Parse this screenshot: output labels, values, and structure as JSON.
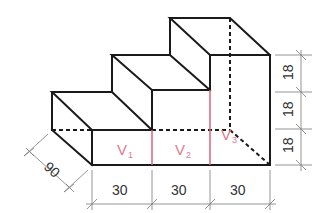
{
  "figure": {
    "colors": {
      "edge": "#1a1a1a",
      "division_line": "#e0607a",
      "volume_label": "#e07a90",
      "dimension_line": "#7a7a7a",
      "dimension_text": "#333333"
    },
    "volume_labels": [
      {
        "main": "V",
        "sub": "1"
      },
      {
        "main": "V",
        "sub": "2"
      },
      {
        "main": "V",
        "sub": "3"
      }
    ],
    "dimensions": {
      "depth": "90",
      "widths": [
        "30",
        "30",
        "30"
      ],
      "heights": [
        "18",
        "18",
        "18"
      ]
    }
  }
}
